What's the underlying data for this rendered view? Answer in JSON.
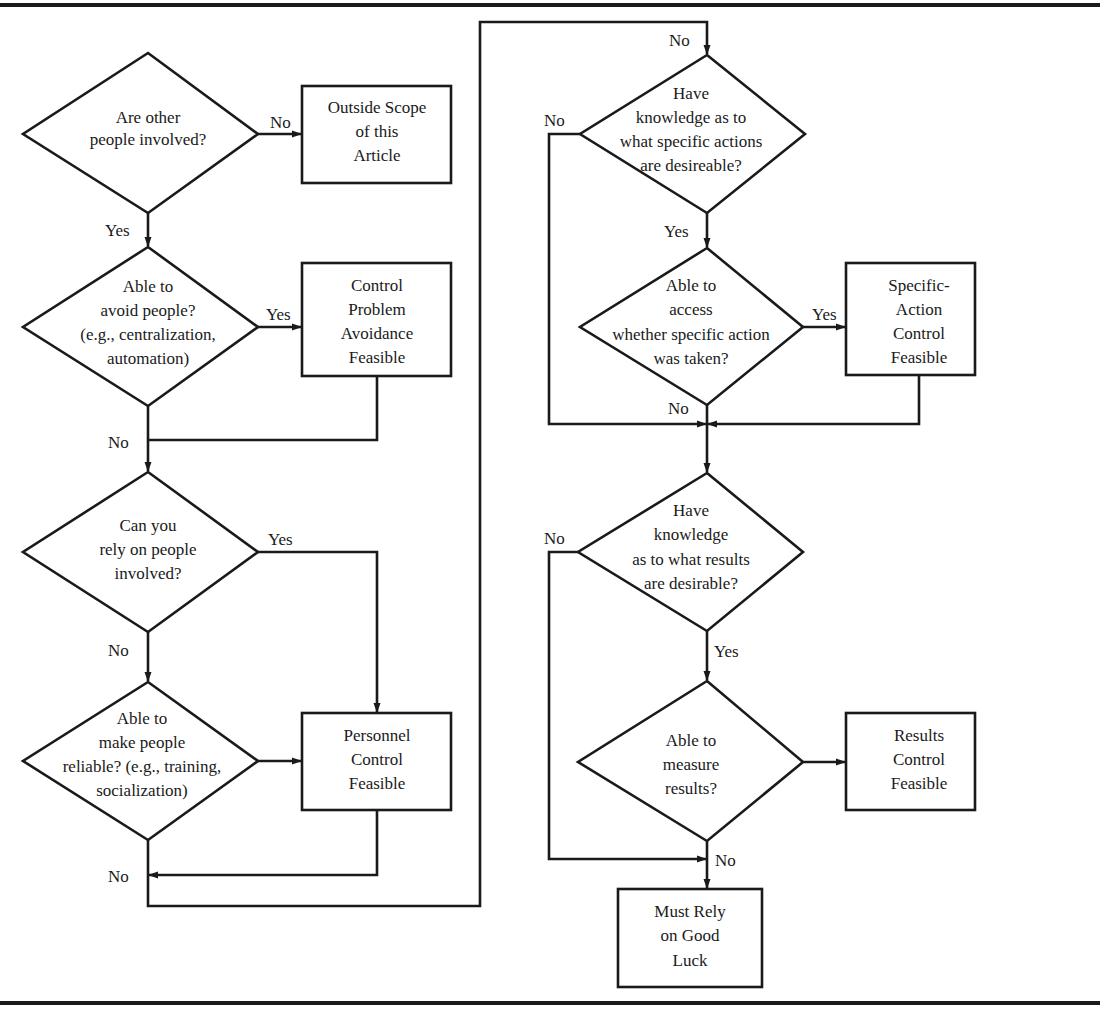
{
  "diagram": {
    "type": "flowchart",
    "colors": {
      "stroke": "#1a1a1a",
      "background": "#ffffff"
    },
    "decisions": [
      {
        "id": "d1",
        "lines": [
          "Are other",
          "people involved?"
        ]
      },
      {
        "id": "d2",
        "lines": [
          "Able to",
          "avoid people?",
          "(e.g., centralization,",
          "automation)"
        ]
      },
      {
        "id": "d3",
        "lines": [
          "Can you",
          "rely on people",
          "involved?"
        ]
      },
      {
        "id": "d4",
        "lines": [
          "Able to",
          "make people",
          "reliable? (e.g., training,",
          "socialization)"
        ]
      },
      {
        "id": "d5",
        "lines": [
          "Have",
          "knowledge as to",
          "what specific actions",
          "are desireable?"
        ]
      },
      {
        "id": "d6",
        "lines": [
          "Able to",
          "access",
          "whether specific action",
          "was taken?"
        ]
      },
      {
        "id": "d7",
        "lines": [
          "Have",
          "knowledge",
          "as to what results",
          "are desirable?"
        ]
      },
      {
        "id": "d8",
        "lines": [
          "Able to",
          "measure",
          "results?"
        ]
      }
    ],
    "outcomes": [
      {
        "id": "o1",
        "lines": [
          "Outside Scope",
          "of this",
          "Article"
        ]
      },
      {
        "id": "o2",
        "lines": [
          "Control",
          "Problem",
          "Avoidance",
          "Feasible"
        ]
      },
      {
        "id": "o3",
        "lines": [
          "Personnel",
          "Control",
          "Feasible"
        ]
      },
      {
        "id": "o4",
        "lines": [
          "Specific-",
          "Action",
          "Control",
          "Feasible"
        ]
      },
      {
        "id": "o5",
        "lines": [
          "Results",
          "Control",
          "Feasible"
        ]
      },
      {
        "id": "o6",
        "lines": [
          "Must Rely",
          "on Good",
          "Luck"
        ]
      }
    ],
    "edge_labels": {
      "d1_no": "No",
      "d1_yes": "Yes",
      "d2_yes": "Yes",
      "d2_no": "No",
      "d3_yes": "Yes",
      "d3_no": "No",
      "d4_no": "No",
      "d5_top_no": "No",
      "d5_no": "No",
      "d5_yes": "Yes",
      "d6_yes": "Yes",
      "d6_no": "No",
      "d7_no": "No",
      "d7_yes": "Yes",
      "d8_no": "No"
    },
    "edges": [
      {
        "from": "d1",
        "to": "o1",
        "label": "No"
      },
      {
        "from": "d1",
        "to": "d2",
        "label": "Yes"
      },
      {
        "from": "d2",
        "to": "o2",
        "label": "Yes"
      },
      {
        "from": "d2",
        "to": "d3",
        "label": "No"
      },
      {
        "from": "o2",
        "to": "d3",
        "label": ""
      },
      {
        "from": "d3",
        "to": "o3",
        "label": "Yes"
      },
      {
        "from": "d3",
        "to": "d4",
        "label": "No"
      },
      {
        "from": "d4",
        "to": "o3",
        "label": ""
      },
      {
        "from": "d4",
        "to": "d5",
        "label": "No"
      },
      {
        "from": "o3",
        "to": "d5",
        "label": ""
      },
      {
        "from": "d5",
        "to": "d6",
        "label": "Yes"
      },
      {
        "from": "d5",
        "to": "d7",
        "label": "No"
      },
      {
        "from": "d6",
        "to": "o4",
        "label": "Yes"
      },
      {
        "from": "d6",
        "to": "d7",
        "label": "No"
      },
      {
        "from": "o4",
        "to": "d7",
        "label": ""
      },
      {
        "from": "d7",
        "to": "d8",
        "label": "Yes"
      },
      {
        "from": "d7",
        "to": "o6",
        "label": "No"
      },
      {
        "from": "d8",
        "to": "o5",
        "label": ""
      },
      {
        "from": "d8",
        "to": "o6",
        "label": "No"
      }
    ]
  }
}
